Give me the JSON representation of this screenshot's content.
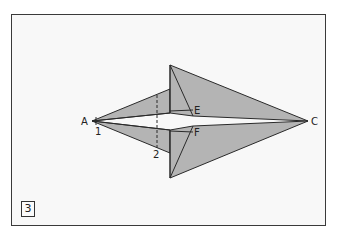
{
  "figure": {
    "step_number": "3",
    "colors": {
      "background": "#f8f8f8",
      "fill": "#b4b4b4",
      "stroke": "#2a2a2a",
      "frame": "#3a3a3a"
    },
    "labels": {
      "A": "A",
      "C": "C",
      "E": "E",
      "F": "F",
      "fold_1": "1",
      "fold_2": "2"
    }
  }
}
